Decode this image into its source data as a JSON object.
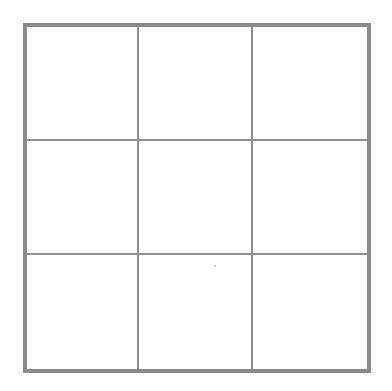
{
  "diagram": {
    "type": "grid",
    "rows": 3,
    "columns": 3,
    "border_color": "#8a8a8a",
    "line_color": "#8f8f8f",
    "background": "#ffffff",
    "cells": [
      {
        "row": 0,
        "col": 0,
        "content": ""
      },
      {
        "row": 0,
        "col": 1,
        "content": ""
      },
      {
        "row": 0,
        "col": 2,
        "content": ""
      },
      {
        "row": 1,
        "col": 0,
        "content": ""
      },
      {
        "row": 1,
        "col": 1,
        "content": ""
      },
      {
        "row": 1,
        "col": 2,
        "content": ""
      },
      {
        "row": 2,
        "col": 0,
        "content": ""
      },
      {
        "row": 2,
        "col": 1,
        "content": ""
      },
      {
        "row": 2,
        "col": 2,
        "content": ""
      }
    ]
  }
}
